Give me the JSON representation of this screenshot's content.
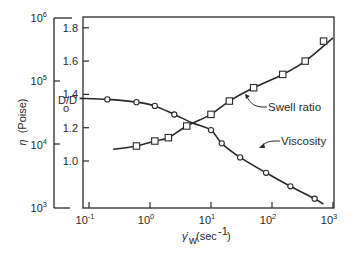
{
  "chart_data": {
    "type": "line",
    "title": "",
    "xlabel": "γ̇w (sec⁻¹)",
    "xlabel_main": "γ̇",
    "xlabel_sub": "w",
    "xlabel_unit": "(sec",
    "xlabel_unit_sup": "-1",
    "xlabel_unit_close": ")",
    "xscale": "log",
    "xlim": [
      0.05,
      1000
    ],
    "x_ticks": [
      {
        "value": 0.1,
        "base": "10",
        "exp": "-1"
      },
      {
        "value": 1,
        "base": "10",
        "exp": "0"
      },
      {
        "value": 10,
        "base": "10",
        "exp": "1"
      },
      {
        "value": 100,
        "base": "10",
        "exp": "2"
      },
      {
        "value": 1000,
        "base": "10",
        "exp": "3"
      }
    ],
    "ylabel_left": "η (Poise)",
    "ylabel_left_symbol": "η",
    "ylabel_left_unit": "(Poise)",
    "y_left_scale": "log",
    "y_left_lim": [
      1000,
      1000000
    ],
    "y_left_ticks": [
      {
        "value": 1000000,
        "base": "10",
        "exp": "6"
      },
      {
        "value": 100000,
        "base": "10",
        "exp": "5"
      },
      {
        "value": 10000,
        "base": "10",
        "exp": "4"
      },
      {
        "value": 1000,
        "base": "10",
        "exp": "3"
      }
    ],
    "ylabel_right": "D/D₀",
    "ylabel_right_main": "D/D",
    "ylabel_right_sub": "o",
    "y_right_lim": [
      0.8,
      1.85
    ],
    "y_right_ticks": [
      "1.8",
      "1.6",
      "1.4",
      "1.2",
      "1.0"
    ],
    "grid": false,
    "legend": "inline annotations with leader arrows",
    "series": [
      {
        "name": "Viscosity",
        "axis": "left",
        "marker": "circle",
        "x": [
          0.2,
          0.6,
          1.2,
          2.5,
          10,
          15,
          30,
          80,
          200,
          500
        ],
        "y": [
          52000,
          47000,
          41000,
          30000,
          17000,
          10500,
          6300,
          3600,
          2200,
          1400
        ],
        "curve_x": [
          0.07,
          0.2,
          0.6,
          1.2,
          2.5,
          5,
          10,
          15,
          30,
          80,
          200,
          500,
          700
        ],
        "curve_y": [
          54000,
          52000,
          47000,
          41000,
          30000,
          22000,
          17000,
          10500,
          6300,
          3600,
          2200,
          1400,
          1150
        ]
      },
      {
        "name": "Swell ratio",
        "axis": "right",
        "marker": "square",
        "x": [
          0.6,
          1.2,
          2,
          4,
          10,
          20,
          50,
          150,
          350,
          700
        ],
        "y": [
          1.09,
          1.12,
          1.14,
          1.21,
          1.28,
          1.36,
          1.44,
          1.52,
          1.6,
          1.72
        ],
        "curve_x": [
          0.25,
          0.6,
          1.2,
          2,
          4,
          10,
          20,
          50,
          150,
          350,
          1000
        ],
        "curve_y": [
          1.07,
          1.09,
          1.12,
          1.14,
          1.21,
          1.28,
          1.36,
          1.44,
          1.52,
          1.6,
          1.74
        ]
      }
    ],
    "annotations": [
      {
        "text": "Swell ratio",
        "target_series": "Swell ratio"
      },
      {
        "text": "Viscosity",
        "target_series": "Viscosity"
      }
    ]
  },
  "colors": {
    "ink": "#2a2a2a",
    "background": "#ffffff"
  }
}
